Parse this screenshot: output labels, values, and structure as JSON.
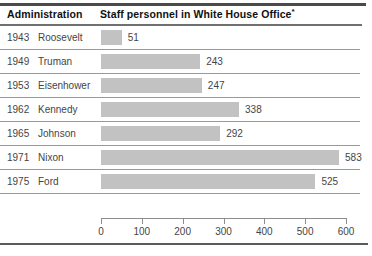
{
  "header": {
    "col_admin": "Administration",
    "col_staff": "Staff personnel in White House Office",
    "footnote_marker": "*"
  },
  "colors": {
    "bar": "#c2c2c2",
    "text": "#454545",
    "heading": "#111111",
    "rule_heavy": "#4a4a4a",
    "rule_light": "#9a9a9a",
    "background": "#ffffff"
  },
  "chart_data": {
    "type": "bar",
    "orientation": "horizontal",
    "title": "Staff personnel in White House Office*",
    "xlabel": "",
    "ylabel": "Administration",
    "xlim": [
      0,
      600
    ],
    "grid": false,
    "legend": null,
    "xticks": [
      0,
      100,
      200,
      300,
      400,
      500,
      600
    ],
    "xticklabels": [
      "0",
      "100",
      "200",
      "300",
      "400",
      "500",
      "600"
    ],
    "categories": [
      "Roosevelt",
      "Truman",
      "Eisenhower",
      "Kennedy",
      "Johnson",
      "Nixon",
      "Ford"
    ],
    "years": [
      "1943",
      "1949",
      "1953",
      "1962",
      "1965",
      "1971",
      "1975"
    ],
    "values": [
      51,
      243,
      247,
      338,
      292,
      583,
      525
    ],
    "rows": [
      {
        "year": "1943",
        "name": "Roosevelt",
        "value": 51,
        "value_label": "51"
      },
      {
        "year": "1949",
        "name": "Truman",
        "value": 243,
        "value_label": "243"
      },
      {
        "year": "1953",
        "name": "Eisenhower",
        "value": 247,
        "value_label": "247"
      },
      {
        "year": "1962",
        "name": "Kennedy",
        "value": 338,
        "value_label": "338"
      },
      {
        "year": "1965",
        "name": "Johnson",
        "value": 292,
        "value_label": "292"
      },
      {
        "year": "1971",
        "name": "Nixon",
        "value": 583,
        "value_label": "583"
      },
      {
        "year": "1975",
        "name": "Ford",
        "value": 525,
        "value_label": "525"
      }
    ]
  }
}
